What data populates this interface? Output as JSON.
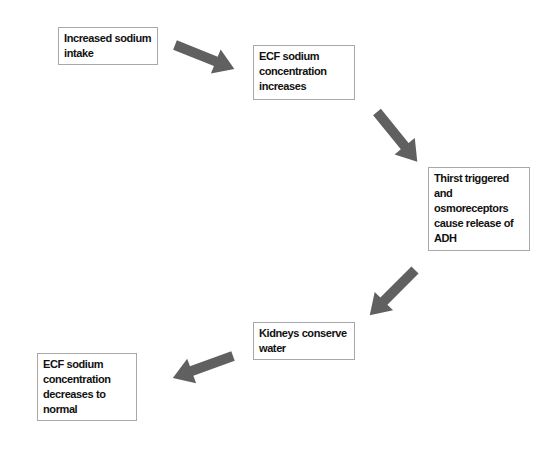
{
  "diagram": {
    "type": "flowchart",
    "arrow_color": "#606060",
    "box_border_color": "#a8a8a8",
    "nodes": [
      {
        "id": "n1",
        "label": "Increased sodium intake"
      },
      {
        "id": "n2",
        "label": "ECF sodium concentration increases"
      },
      {
        "id": "n3",
        "label": "Thirst triggered and osmoreceptors cause release of ADH"
      },
      {
        "id": "n4",
        "label": "Kidneys conserve water"
      },
      {
        "id": "n5",
        "label": "ECF sodium concentration decreases to normal"
      }
    ],
    "edges": [
      {
        "from": "n1",
        "to": "n2"
      },
      {
        "from": "n2",
        "to": "n3"
      },
      {
        "from": "n3",
        "to": "n4"
      },
      {
        "from": "n4",
        "to": "n5"
      }
    ]
  }
}
